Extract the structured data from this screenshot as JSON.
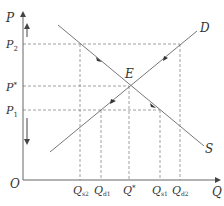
{
  "diagram": {
    "axes": {
      "y_label": "P",
      "x_label": "Q",
      "origin_label": "O"
    },
    "price_levels": [
      {
        "id": "p2",
        "label": "P",
        "sub": "2"
      },
      {
        "id": "pstar",
        "label": "P",
        "sup": "*"
      },
      {
        "id": "p1",
        "label": "P",
        "sub": "1"
      }
    ],
    "quantity_levels": [
      {
        "id": "qs2",
        "label": "Q",
        "sub": "s2"
      },
      {
        "id": "qd1",
        "label": "Q",
        "sub": "d1"
      },
      {
        "id": "qstar",
        "label": "Q",
        "sup": "*"
      },
      {
        "id": "qs1",
        "label": "Q",
        "sub": "s1"
      },
      {
        "id": "qd2",
        "label": "Q",
        "sub": "d2"
      }
    ],
    "curves": {
      "upward_label": "D",
      "downward_label": "S"
    },
    "equilibrium_label": "E",
    "arrows": {
      "axis_up": "price rises",
      "axis_down": "price falls"
    }
  }
}
